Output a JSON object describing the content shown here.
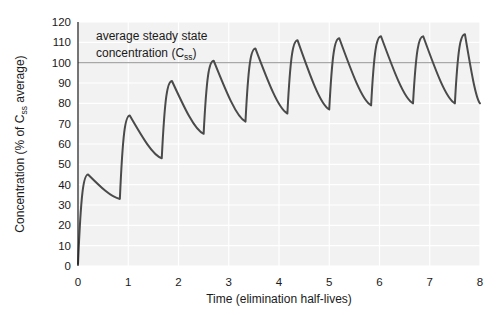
{
  "chart_data": {
    "type": "line",
    "title": "",
    "xlabel": "Time (elimination half-lives)",
    "ylabel": "Concentration (% of C_ss average)",
    "ylabel_parts": {
      "pre": "Concentration (% of C",
      "sub": "ss",
      "post": " average)"
    },
    "xlim": [
      0,
      8
    ],
    "ylim": [
      0,
      120
    ],
    "xticks": [
      0,
      1,
      2,
      3,
      4,
      5,
      6,
      7,
      8
    ],
    "xtick_labels": [
      "0",
      "1",
      "2",
      "3",
      "4",
      "5",
      "6",
      "7",
      "8"
    ],
    "yticks": [
      0,
      10,
      20,
      30,
      40,
      50,
      60,
      70,
      80,
      90,
      100,
      110,
      120
    ],
    "ytick_labels": [
      "0",
      "10",
      "20",
      "30",
      "40",
      "50",
      "60",
      "70",
      "80",
      "90",
      "100",
      "110",
      "120"
    ],
    "grid": true,
    "legend": "none",
    "annotations": [
      {
        "name": "css-annotation",
        "line1": "average steady state",
        "line2_pre": "concentration  (C",
        "line2_sub": "ss",
        "line2_post": ")",
        "x": 0.45,
        "y": 115
      }
    ],
    "reference_lines": [
      {
        "name": "css-average-line",
        "label": "C_ss average",
        "value": 100,
        "orientation": "horizontal",
        "color": "#a8a8a8"
      }
    ],
    "series": [
      {
        "name": "plasma-concentration",
        "color": "#4a4a4a",
        "dose_interval_half_lives": 0.833,
        "peak_offset_half_lives": 0.2,
        "peaks": [
          {
            "t": 0.2,
            "c": 45
          },
          {
            "t": 1.03,
            "c": 74
          },
          {
            "t": 1.87,
            "c": 91
          },
          {
            "t": 2.7,
            "c": 101
          },
          {
            "t": 3.53,
            "c": 107
          },
          {
            "t": 4.37,
            "c": 111
          },
          {
            "t": 5.2,
            "c": 112
          },
          {
            "t": 6.03,
            "c": 113
          },
          {
            "t": 6.87,
            "c": 113
          },
          {
            "t": 7.7,
            "c": 114
          }
        ],
        "troughs": [
          {
            "t": 0.833,
            "c": 33
          },
          {
            "t": 1.667,
            "c": 53
          },
          {
            "t": 2.5,
            "c": 65
          },
          {
            "t": 3.333,
            "c": 71
          },
          {
            "t": 4.167,
            "c": 75
          },
          {
            "t": 5.0,
            "c": 77
          },
          {
            "t": 5.833,
            "c": 79
          },
          {
            "t": 6.667,
            "c": 80
          },
          {
            "t": 7.5,
            "c": 80
          }
        ],
        "start": {
          "t": 0,
          "c": 1
        },
        "end": {
          "t": 8,
          "c": 80
        }
      }
    ],
    "colors": {
      "curve": "#4a4a4a",
      "plot_background": "#f2f2f2",
      "gridline": "#ffffff",
      "reference_line": "#a8a8a8",
      "axis_text": "#1a1a1a",
      "figure_background": "#ffffff"
    }
  }
}
